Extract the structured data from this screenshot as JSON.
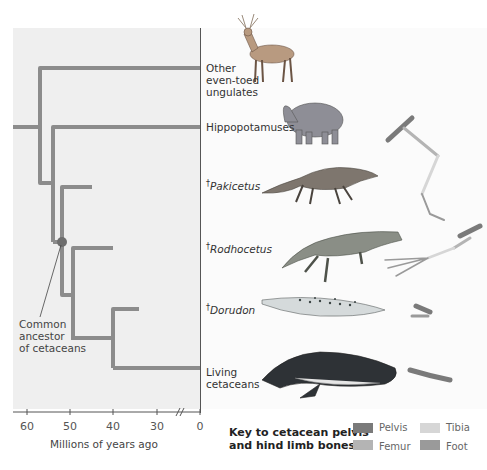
{
  "diagram": {
    "taxa": [
      {
        "id": "ungulates",
        "label_lines": [
          "Other",
          "even-toed",
          "ungulates"
        ],
        "extinct": false
      },
      {
        "id": "hippos",
        "label_lines": [
          "Hippopotamuses"
        ],
        "extinct": false
      },
      {
        "id": "pakicetus",
        "label_lines": [
          "Pakicetus"
        ],
        "extinct": true
      },
      {
        "id": "rodhocetus",
        "label_lines": [
          "Rodhocetus"
        ],
        "extinct": true
      },
      {
        "id": "dorudon",
        "label_lines": [
          "Dorudon"
        ],
        "extinct": true
      },
      {
        "id": "living",
        "label_lines": [
          "Living",
          "cetaceans"
        ],
        "extinct": false
      }
    ],
    "extinct_marker": "†",
    "ancestor_annotation": [
      "Common",
      "ancestor",
      "of cetaceans"
    ],
    "axis": {
      "label": "Millions of years ago",
      "ticks": [
        "60",
        "50",
        "40",
        "30",
        "0"
      ],
      "break_symbol": "//"
    },
    "key": {
      "title_lines": [
        "Key to cetacean pelvis",
        "and hind limb bones"
      ],
      "items": [
        {
          "label": "Pelvis",
          "color": "#7a7a7a"
        },
        {
          "label": "Tibia",
          "color": "#d6d6d6"
        },
        {
          "label": "Femur",
          "color": "#b4b4b4"
        },
        {
          "label": "Foot",
          "color": "#9a9a9a"
        }
      ]
    },
    "colors": {
      "branch": "#8c8c8c",
      "panel_bg": "#efefef",
      "node": "#6e6e6e"
    }
  }
}
